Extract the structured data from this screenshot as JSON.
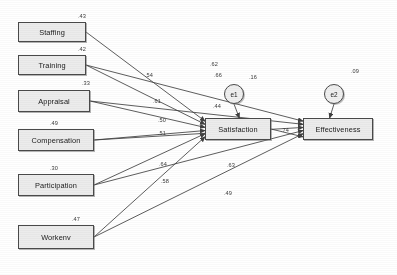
{
  "diagram": {
    "type": "path-diagram",
    "title": "",
    "exogenous_nodes": [
      {
        "id": "staffing",
        "label": "Staffing",
        "variance": ".43",
        "x": 18,
        "y": 22,
        "w": 68,
        "h": 20
      },
      {
        "id": "training",
        "label": "Training",
        "variance": ".42",
        "x": 18,
        "y": 55,
        "w": 68,
        "h": 20
      },
      {
        "id": "appraisal",
        "label": "Appraisal",
        "variance": ".33",
        "x": 18,
        "y": 90,
        "w": 72,
        "h": 22
      },
      {
        "id": "compensation",
        "label": "Compensation",
        "variance": ".49",
        "x": 18,
        "y": 129,
        "w": 76,
        "h": 22
      },
      {
        "id": "participation",
        "label": "Participation",
        "variance": ".30",
        "x": 18,
        "y": 174,
        "w": 76,
        "h": 22
      },
      {
        "id": "workenv",
        "label": "Workenv",
        "variance": ".47",
        "x": 18,
        "y": 225,
        "w": 76,
        "h": 24
      }
    ],
    "endogenous_nodes": [
      {
        "id": "satisfaction",
        "label": "Satisfaction",
        "x": 205,
        "y": 118,
        "w": 66,
        "h": 22
      },
      {
        "id": "effectiveness",
        "label": "Effectiveness",
        "x": 303,
        "y": 118,
        "w": 70,
        "h": 22
      }
    ],
    "error_terms": [
      {
        "id": "e1",
        "label": "e1",
        "x": 224,
        "y": 84
      },
      {
        "id": "e2",
        "label": "e2",
        "x": 324,
        "y": 84
      }
    ],
    "paths": [
      {
        "from": "staffing",
        "to": "satisfaction",
        "coefficient": ".62",
        "label_x": 210,
        "label_y": 61
      },
      {
        "from": "training",
        "to": "satisfaction",
        "coefficient": ".54",
        "label_x": 145,
        "label_y": 72
      },
      {
        "from": "appraisal",
        "to": "satisfaction",
        "coefficient": ".61",
        "label_x": 153,
        "label_y": 98
      },
      {
        "from": "compensation",
        "to": "satisfaction",
        "coefficient": ".51",
        "label_x": 158,
        "label_y": 130
      },
      {
        "from": "participation",
        "to": "satisfaction",
        "coefficient": ".64",
        "label_x": 159,
        "label_y": 161
      },
      {
        "from": "workenv",
        "to": "satisfaction",
        "coefficient": ".58",
        "label_x": 161,
        "label_y": 178
      },
      {
        "from": "training",
        "to": "effectiveness",
        "coefficient": ".66",
        "label_x": 214,
        "label_y": 72
      },
      {
        "from": "appraisal",
        "to": "effectiveness",
        "coefficient": ".44",
        "label_x": 213,
        "label_y": 103
      },
      {
        "from": "compensation",
        "to": "effectiveness",
        "coefficient": ".50",
        "label_x": 158,
        "label_y": 117
      },
      {
        "from": "participation",
        "to": "effectiveness",
        "coefficient": ".63",
        "label_x": 227,
        "label_y": 162
      },
      {
        "from": "workenv",
        "to": "effectiveness",
        "coefficient": ".49",
        "label_x": 224,
        "label_y": 190
      },
      {
        "from": "satisfaction",
        "to": "effectiveness",
        "coefficient": ".74",
        "label_x": 281,
        "label_y": 127
      },
      {
        "from": "e1",
        "to": "satisfaction",
        "coefficient": ".16",
        "label_x": 249,
        "label_y": 74
      },
      {
        "from": "e2",
        "to": "effectiveness",
        "coefficient": ".09",
        "label_x": 351,
        "label_y": 68
      }
    ],
    "colors": {
      "node_fill": "#ececec",
      "node_border": "#4a4a4a",
      "arrow": "#262626",
      "text": "#1a1a1a",
      "background": "#ffffff"
    }
  }
}
